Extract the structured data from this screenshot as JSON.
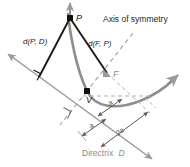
{
  "figure": {
    "kind": "parabola-definition-diagram",
    "background": "#ffffff",
    "labels": {
      "axis_of_symmetry": "Axis of symmetry",
      "dist_point_to_directrix": "d(P, D)",
      "dist_focus_to_point": "d(F, P)",
      "point_p": "P",
      "point_f": "F",
      "vertex_v": "V",
      "seg_a_upper": "a",
      "seg_a_lower": "a",
      "seg_two_a": "2a",
      "directrix_word": "Directrix",
      "directrix_symbol": "D"
    },
    "colors": {
      "curve": "#8e8e8e",
      "solid_line": "#1a1a1a",
      "directrix": "#9a9a9a",
      "dashed": "#a8a8a8",
      "dimension": "#6e6e6e",
      "point_fill": "#111111",
      "focus_fill": "#9a9a9a",
      "text_dark": "#1a1a1a",
      "text_gray": "#8c8c8c"
    },
    "points": {
      "P": {
        "x": 70,
        "y": 18
      },
      "F": {
        "x": 107,
        "y": 73
      },
      "V": {
        "x": 87,
        "y": 91
      },
      "foot_of_perpendicular": {
        "x": 39,
        "y": 77
      }
    }
  }
}
